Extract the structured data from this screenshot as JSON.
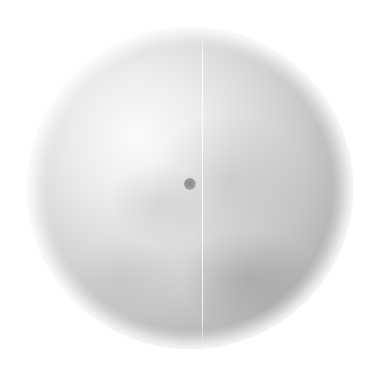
{
  "image": {
    "subject": "grayscale textured sphere",
    "background_color": "#ffffff",
    "sphere": {
      "center": [
        190,
        188
      ],
      "radius": 162,
      "highlight_color": "#fbfbfb",
      "shadow_color": "#9d9d9d",
      "light_direction": "upper-left"
    },
    "features": [
      {
        "name": "meridian-line",
        "x": 203,
        "y_range": [
          28,
          348
        ],
        "color": "#ffffff"
      },
      {
        "name": "center-spot",
        "center": [
          190,
          184
        ],
        "diameter": 12,
        "color": "#8a8a8a"
      }
    ]
  }
}
